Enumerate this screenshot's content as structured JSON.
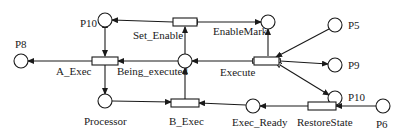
{
  "diagram": {
    "type": "petri-net",
    "places": [
      {
        "id": "P10a",
        "label": "P10",
        "x": 105,
        "y": 20
      },
      {
        "id": "EnableMark",
        "label": "EnableMark",
        "x": 268,
        "y": 22
      },
      {
        "id": "P5",
        "label": "P5",
        "x": 335,
        "y": 25
      },
      {
        "id": "P8",
        "label": "P8",
        "x": 21,
        "y": 61
      },
      {
        "id": "Being_executed",
        "label": "Being_executed",
        "x": 185,
        "y": 61
      },
      {
        "id": "P9",
        "label": "P9",
        "x": 335,
        "y": 65
      },
      {
        "id": "P10b",
        "label": "P10",
        "x": 335,
        "y": 98
      },
      {
        "id": "Processor",
        "label": "Processor",
        "x": 105,
        "y": 101
      },
      {
        "id": "Exec_Ready",
        "label": "Exec_Ready",
        "x": 253,
        "y": 106
      },
      {
        "id": "P6",
        "label": "P6",
        "x": 383,
        "y": 106
      }
    ],
    "transitions": [
      {
        "id": "Set_Enable",
        "label": "Set_Enable",
        "x": 185,
        "y": 22
      },
      {
        "id": "A_Exec",
        "label": "A_Exec",
        "x": 105,
        "y": 61
      },
      {
        "id": "Execute",
        "label": "Execute",
        "x": 266,
        "y": 61
      },
      {
        "id": "B_Exec",
        "label": "B_Exec",
        "x": 185,
        "y": 103
      },
      {
        "id": "RestoreState",
        "label": "RestoreState",
        "x": 322,
        "y": 106
      }
    ],
    "arcs": [
      {
        "from": "Set_Enable",
        "to": "P10a"
      },
      {
        "from": "Set_Enable",
        "to": "EnableMark",
        "inhibitor_end": "Set_Enable"
      },
      {
        "from": "Being_executed",
        "to": "Set_Enable"
      },
      {
        "from": "P10a",
        "to": "A_Exec",
        "bidirectional": true
      },
      {
        "from": "A_Exec",
        "to": "P8"
      },
      {
        "from": "Being_executed",
        "to": "A_Exec"
      },
      {
        "from": "A_Exec",
        "to": "Processor"
      },
      {
        "from": "Execute",
        "to": "Being_executed",
        "inhibitor_end": "Execute"
      },
      {
        "from": "Execute",
        "to": "EnableMark"
      },
      {
        "from": "P5",
        "to": "Execute"
      },
      {
        "from": "Execute",
        "to": "P9",
        "inhibitor_end": "Execute"
      },
      {
        "from": "Execute",
        "to": "P10b",
        "inhibitor_end": "Execute"
      },
      {
        "from": "Processor",
        "to": "B_Exec"
      },
      {
        "from": "B_Exec",
        "to": "Being_executed"
      },
      {
        "from": "Exec_Ready",
        "to": "B_Exec"
      },
      {
        "from": "RestoreState",
        "to": "Exec_Ready"
      },
      {
        "from": "P6",
        "to": "RestoreState"
      }
    ]
  },
  "labels": {
    "p10_top": "P10",
    "set_enable": "Set_Enable",
    "enable_mark": "EnableMark",
    "p5": "P5",
    "p8": "P8",
    "a_exec": "A_Exec",
    "being_executed": "Being_executed",
    "execute": "Execute",
    "p9": "P9",
    "p10_right": "P10",
    "processor": "Processor",
    "b_exec": "B_Exec",
    "exec_ready": "Exec_Ready",
    "restore_state": "RestoreState",
    "p6": "P6"
  },
  "colors": {
    "stroke": "#1a1a1a",
    "background": "#ffffff"
  }
}
